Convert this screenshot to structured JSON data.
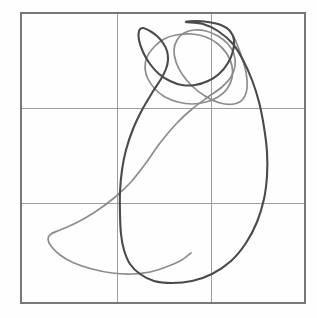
{
  "figure": {
    "kind": "phase-plane-plot",
    "background_color": "#fefefe",
    "width": 317,
    "height": 318,
    "title": "",
    "subtitle": "",
    "caption": ""
  },
  "frame": {
    "name": "plot-frame",
    "left": 21,
    "top": 13,
    "right": 305,
    "bottom": 303,
    "stroke_color": "#777777",
    "stroke_width": 1.1
  },
  "grid": {
    "visible": "true",
    "stroke_color": "#8e8e8e",
    "stroke_width": 1,
    "columns": 3,
    "rows": 3,
    "x_lines": [
      117,
      211
    ],
    "y_lines": [
      108,
      203
    ]
  },
  "legend": {
    "visible": "false",
    "position": "none",
    "entries": [
      {
        "label": "trajectory-dark",
        "color": "#4a4a4a"
      },
      {
        "label": "trajectory-light",
        "color": "#8c8c8c"
      }
    ]
  },
  "axes": {
    "xlabel": "",
    "ylabel": "",
    "x_tick_labels": [],
    "y_tick_labels": []
  },
  "chart_data": {
    "type": "line",
    "title": "",
    "xlabel": "",
    "ylabel": "",
    "grid": "on",
    "legend_position": "none",
    "xlim": [
      21,
      305
    ],
    "ylim": [
      303,
      13
    ],
    "grid_x": [
      117,
      211
    ],
    "grid_y": [
      108,
      203
    ],
    "series": [
      {
        "name": "trajectory-dark",
        "color": "#4a4a4a",
        "width": 2.1,
        "closed": "true",
        "points": [
          [
            186,
            22
          ],
          [
            203,
            24
          ],
          [
            218,
            31
          ],
          [
            233,
            44
          ],
          [
            243,
            60
          ],
          [
            252,
            80
          ],
          [
            259,
            102
          ],
          [
            264,
            127
          ],
          [
            267,
            152
          ],
          [
            267,
            176
          ],
          [
            264,
            199
          ],
          [
            257,
            222
          ],
          [
            246,
            243
          ],
          [
            231,
            261
          ],
          [
            212,
            274
          ],
          [
            192,
            281
          ],
          [
            172,
            283
          ],
          [
            154,
            281
          ],
          [
            140,
            274
          ],
          [
            130,
            264
          ],
          [
            124,
            250
          ],
          [
            121,
            234
          ],
          [
            120,
            214
          ],
          [
            120,
            192
          ],
          [
            122,
            170
          ],
          [
            126,
            150
          ],
          [
            133,
            129
          ],
          [
            142,
            110
          ],
          [
            152,
            93
          ],
          [
            161,
            79
          ],
          [
            166,
            69
          ],
          [
            168,
            60
          ],
          [
            167,
            51
          ],
          [
            163,
            43
          ],
          [
            157,
            36
          ],
          [
            150,
            31
          ],
          [
            143,
            28
          ],
          [
            139,
            31
          ],
          [
            139,
            40
          ],
          [
            143,
            52
          ],
          [
            150,
            64
          ],
          [
            159,
            74
          ],
          [
            170,
            81
          ],
          [
            182,
            85
          ],
          [
            195,
            85
          ],
          [
            208,
            81
          ],
          [
            219,
            74
          ],
          [
            228,
            63
          ],
          [
            233,
            51
          ],
          [
            234,
            40
          ],
          [
            230,
            31
          ],
          [
            221,
            25
          ],
          [
            208,
            22
          ],
          [
            196,
            21
          ],
          [
            186,
            22
          ]
        ]
      },
      {
        "name": "trajectory-light",
        "color": "#8c8c8c",
        "width": 1.7,
        "closed": "true",
        "points": [
          [
            176,
            35
          ],
          [
            192,
            34
          ],
          [
            206,
            37
          ],
          [
            218,
            44
          ],
          [
            227,
            54
          ],
          [
            232,
            66
          ],
          [
            232,
            78
          ],
          [
            227,
            89
          ],
          [
            218,
            97
          ],
          [
            206,
            102
          ],
          [
            192,
            104
          ],
          [
            178,
            102
          ],
          [
            165,
            97
          ],
          [
            155,
            89
          ],
          [
            148,
            79
          ],
          [
            145,
            68
          ],
          [
            147,
            57
          ],
          [
            154,
            47
          ],
          [
            164,
            39
          ],
          [
            176,
            35
          ]
        ]
      },
      {
        "name": "trajectory-light-outer",
        "color": "#8c8c8c",
        "width": 1.7,
        "closed": "false",
        "points": [
          [
            234,
            37
          ],
          [
            240,
            52
          ],
          [
            246,
            72
          ],
          [
            247,
            88
          ],
          [
            243,
            99
          ],
          [
            234,
            104
          ],
          [
            220,
            103
          ],
          [
            205,
            96
          ],
          [
            192,
            86
          ],
          [
            182,
            74
          ],
          [
            176,
            62
          ],
          [
            174,
            50
          ],
          [
            177,
            40
          ],
          [
            184,
            33
          ],
          [
            194,
            30
          ],
          [
            206,
            31
          ],
          [
            218,
            36
          ],
          [
            228,
            44
          ],
          [
            234,
            54
          ],
          [
            235,
            66
          ],
          [
            231,
            77
          ],
          [
            222,
            87
          ],
          [
            208,
            97
          ],
          [
            192,
            109
          ],
          [
            176,
            124
          ],
          [
            160,
            143
          ],
          [
            146,
            163
          ],
          [
            131,
            182
          ],
          [
            114,
            198
          ],
          [
            95,
            212
          ],
          [
            76,
            223
          ],
          [
            60,
            230
          ],
          [
            51,
            234
          ],
          [
            48,
            239
          ],
          [
            51,
            246
          ],
          [
            60,
            255
          ],
          [
            74,
            263
          ],
          [
            92,
            269
          ],
          [
            112,
            273
          ],
          [
            132,
            274
          ],
          [
            150,
            272
          ],
          [
            166,
            267
          ],
          [
            180,
            261
          ],
          [
            191,
            253
          ]
        ]
      }
    ]
  }
}
